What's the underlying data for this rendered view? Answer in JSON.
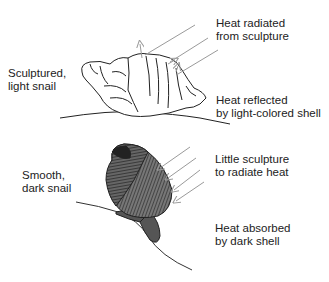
{
  "panels": [
    {
      "id": "top",
      "snail_label_line1": "Sculptured,",
      "snail_label_line2": "light snail",
      "callout1_line1": "Heat radiated",
      "callout1_line2": "from sculpture",
      "callout2_line1": "Heat reflected",
      "callout2_line2": "by light-colored shell"
    },
    {
      "id": "bottom",
      "snail_label_line1": "Smooth,",
      "snail_label_line2": "dark snail",
      "callout1_line1": "Little sculpture",
      "callout1_line2": "to radiate heat",
      "callout2_line1": "Heat absorbed",
      "callout2_line2": "by dark shell"
    }
  ],
  "colors": {
    "arrow": "#9a9a9a",
    "outline": "#222222",
    "dark_shell": "#555555",
    "background": "#ffffff"
  }
}
